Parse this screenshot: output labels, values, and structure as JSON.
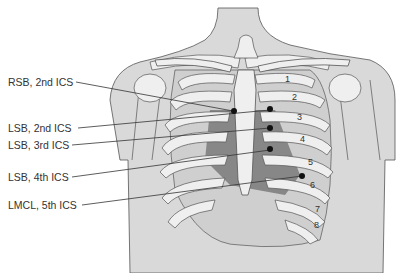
{
  "diagram": {
    "labels": [
      {
        "text": "RSB, 2nd ICS",
        "x": 8,
        "y": 76
      },
      {
        "text": "LSB, 2nd ICS",
        "x": 8,
        "y": 123
      },
      {
        "text": "LSB, 3rd ICS",
        "x": 8,
        "y": 140
      },
      {
        "text": "LSB, 4th ICS",
        "x": 8,
        "y": 172
      },
      {
        "text": "LMCL, 5th ICS",
        "x": 8,
        "y": 200
      }
    ],
    "rib_numbers": [
      "1",
      "2",
      "3",
      "4",
      "5",
      "6",
      "7",
      "8"
    ],
    "colors": {
      "skin": "#d9d9d9",
      "bone": "#efefef",
      "outline": "#555555",
      "heart_shading": "#7a7a7a",
      "marker": "#111111"
    }
  }
}
